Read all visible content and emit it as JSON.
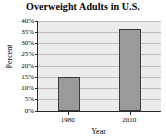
{
  "chart_data": {
    "type": "bar",
    "title": "Overweight Adults in U.S.",
    "xlabel": "Year",
    "ylabel": "Percent",
    "categories": [
      "1980",
      "2010"
    ],
    "values": [
      15,
      36.5
    ],
    "value_labels": [
      "15%",
      "36.5%"
    ],
    "ylim": [
      0,
      40
    ],
    "ytick_values": [
      0,
      5,
      10,
      15,
      20,
      25,
      30,
      35,
      40
    ],
    "ytick_labels": [
      "0%",
      "5%",
      "10%",
      "15%",
      "20%",
      "25%",
      "30%",
      "35%",
      "40%"
    ],
    "grid": true,
    "legend": "none",
    "series": [
      {
        "name": "Percent of overweight adults",
        "values": [
          15,
          36.5
        ]
      }
    ],
    "colors": {
      "bar_fill": "#9a9a9a",
      "bar_edge": "#3a3a3a",
      "plot_background": "#ececed",
      "gridline": "#bcbcbc",
      "axis": "#2b2b2b",
      "text": "#000000",
      "page_background": "#ffffff"
    }
  }
}
